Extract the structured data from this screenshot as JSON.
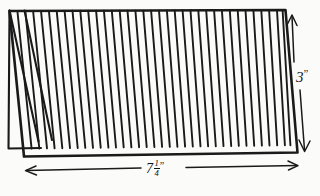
{
  "drawing": {
    "title": "Grill grate dimension sketch",
    "type": "technical-hand-sketch",
    "background_color": "#fbfbfa",
    "ink_color": "#1a1a1a"
  },
  "dimensions": {
    "height": {
      "whole": "3",
      "fraction_numerator": "",
      "fraction_denominator": "",
      "unit_mark": "”",
      "full_text": "3”",
      "orientation": "vertical",
      "arrow_style": "double-headed",
      "position": "right"
    },
    "width": {
      "whole": "7",
      "fraction_numerator": "1",
      "fraction_denominator": "4",
      "unit_mark": "”",
      "full_text": "7 1/4”",
      "orientation": "horizontal",
      "arrow_style": "double-headed",
      "position": "bottom"
    }
  },
  "grate": {
    "bar_count": 35,
    "bar_orientation": "slanted",
    "panel_shape": "parallelogram",
    "back_panel_visible": true
  },
  "icons": {
    "arrow_up": "arrow-up-icon",
    "arrow_down": "arrow-down-icon",
    "arrow_left": "arrow-left-icon",
    "arrow_right": "arrow-right-icon"
  }
}
